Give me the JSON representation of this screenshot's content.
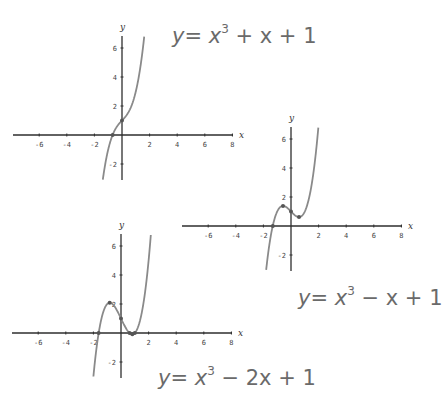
{
  "chart_data": [
    {
      "type": "line",
      "title": "y = x^3 + x + 1",
      "function": {
        "a3": 1,
        "a2": 0,
        "a1": 1,
        "a0": 1
      },
      "xlabel": "x",
      "ylabel": "y",
      "xlim": [
        -7.9,
        8
      ],
      "ylim": [
        -3.1,
        6.8
      ],
      "x_ticks": [
        -6,
        -4,
        -2,
        2,
        4,
        6,
        8
      ],
      "y_ticks": [
        -2,
        2,
        4,
        6
      ],
      "marked_points": [
        [
          -0.68,
          0
        ],
        [
          0,
          1
        ]
      ],
      "grid": false,
      "layout": {
        "origin_px": [
          122,
          135
        ],
        "px_per_x": 13.8,
        "px_per_y": 14.5,
        "x_axis_px": [
          13,
          233
        ],
        "y_axis_px": [
          36,
          180
        ],
        "title_px": [
          172,
          26
        ]
      }
    },
    {
      "type": "line",
      "title": "y = x^3 - x + 1",
      "function": {
        "a3": 1,
        "a2": 0,
        "a1": -1,
        "a0": 1
      },
      "xlabel": "x",
      "ylabel": "y",
      "xlim": [
        -7.9,
        8
      ],
      "ylim": [
        -3.1,
        6.8
      ],
      "x_ticks": [
        -6,
        -4,
        -2,
        2,
        4,
        6,
        8
      ],
      "y_ticks": [
        -2,
        2,
        4,
        6
      ],
      "marked_points": [
        [
          -1.32,
          0
        ],
        [
          -0.58,
          1.38
        ],
        [
          0,
          1
        ],
        [
          0.58,
          0.62
        ]
      ],
      "grid": false,
      "layout": {
        "origin_px": [
          291,
          226
        ],
        "px_per_x": 13.8,
        "px_per_y": 14.5,
        "x_axis_px": [
          182,
          402
        ],
        "y_axis_px": [
          127,
          271
        ],
        "title_px": [
          298,
          288
        ]
      }
    },
    {
      "type": "line",
      "title": "y = x^3 - 2x + 1",
      "function": {
        "a3": 1,
        "a2": 0,
        "a1": -2,
        "a0": 1
      },
      "xlabel": "x",
      "ylabel": "y",
      "xlim": [
        -7.9,
        8
      ],
      "ylim": [
        -3.1,
        6.8
      ],
      "x_ticks": [
        -6,
        -4,
        -2,
        2,
        4,
        6,
        8
      ],
      "y_ticks": [
        -2,
        2,
        4,
        6
      ],
      "marked_points": [
        [
          -1.62,
          0
        ],
        [
          -0.82,
          2.09
        ],
        [
          0,
          1
        ],
        [
          0.62,
          0
        ],
        [
          0.82,
          -0.09
        ],
        [
          1,
          0
        ]
      ],
      "grid": false,
      "layout": {
        "origin_px": [
          121,
          333
        ],
        "px_per_x": 13.8,
        "px_per_y": 14.5,
        "x_axis_px": [
          12,
          232
        ],
        "y_axis_px": [
          234,
          378
        ],
        "title_px": [
          158,
          368
        ]
      }
    }
  ],
  "equations": {
    "eq1": {
      "lhs": "y",
      "eq": "=",
      "x": "x",
      "power": "3",
      "rest": " + x + 1"
    },
    "eq2": {
      "lhs": "y",
      "eq": "=",
      "x": "x",
      "power": "3",
      "rest": " − x + 1"
    },
    "eq3": {
      "lhs": "y",
      "eq": "=",
      "x": "x",
      "power": "3",
      "rest": " − 2x + 1"
    }
  },
  "colors": {
    "curve": "#8a8a8a",
    "axis": "#2e2e2e",
    "point": "#555555",
    "equation": "#6a6a6a"
  }
}
